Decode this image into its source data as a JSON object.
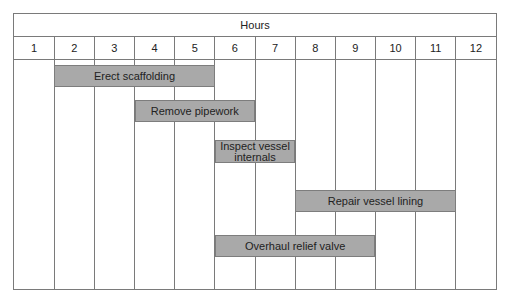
{
  "chart_data": {
    "type": "gantt",
    "title": "Hours",
    "columns": [
      "1",
      "2",
      "3",
      "4",
      "5",
      "6",
      "7",
      "8",
      "9",
      "10",
      "11",
      "12"
    ],
    "tasks": [
      {
        "name": "Erect scaffolding",
        "start_hour": 2,
        "end_hour": 4,
        "row": 0
      },
      {
        "name": "Remove pipework",
        "start_hour": 4,
        "end_hour": 6,
        "row": 1
      },
      {
        "name": "Inspect vessel internals",
        "start_hour": 6,
        "end_hour": 7,
        "row": 2
      },
      {
        "name": "Repair vessel lining",
        "start_hour": 8,
        "end_hour": 11,
        "row": 3
      },
      {
        "name": "Overhaul relief valve",
        "start_hour": 6,
        "end_hour": 9,
        "row": 4
      }
    ],
    "grid": true,
    "bar_color": "#a9a9a9"
  },
  "header": {
    "title": "Hours"
  },
  "hours": [
    "1",
    "2",
    "3",
    "4",
    "5",
    "6",
    "7",
    "8",
    "9",
    "10",
    "11",
    "12"
  ],
  "bars": [
    {
      "label": "Erect scaffolding",
      "col_start": 1,
      "col_span": 4,
      "top": 51,
      "height": 22
    },
    {
      "label": "Remove pipework",
      "col_start": 3,
      "col_span": 3,
      "top": 86,
      "height": 22
    },
    {
      "label": "Inspect vessel internals",
      "col_start": 5,
      "col_span": 2,
      "top": 126,
      "height": 23
    },
    {
      "label": "Repair vessel lining",
      "col_start": 7,
      "col_span": 4,
      "top": 176,
      "height": 22
    },
    {
      "label": "Overhaul relief valve",
      "col_start": 5,
      "col_span": 4,
      "top": 221,
      "height": 22
    }
  ]
}
